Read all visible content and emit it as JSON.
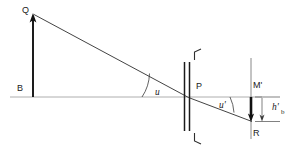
{
  "figure": {
    "kind": "optical-ray-diagram",
    "background_color": "#ffffff",
    "ink_color": "#1a1a1a",
    "axis_color": "#9a9a9a",
    "width": 293,
    "height": 150
  },
  "labels": {
    "object_top": "Q",
    "object_base": "B",
    "lens_vertex": "P",
    "image_plane_top": "M'",
    "image_point": "R",
    "angle_object": "u",
    "angle_image": "u'",
    "image_height": "h'",
    "image_height_sub": "b"
  },
  "geometry": {
    "optical_axis": {
      "x1": 10,
      "y1": 97,
      "x2": 262,
      "y2": 97
    },
    "object_arrow": {
      "x": 33,
      "y_base": 97,
      "y_tip": 16
    },
    "lens_plane_x": 188,
    "image_plane": {
      "x": 251,
      "y_top": 58,
      "y_bottom": 139
    },
    "image_arrow": {
      "x": 251,
      "y_base": 97,
      "y_tip": 121
    },
    "incident_ray": {
      "x1": 33,
      "y1": 16,
      "x2": 188,
      "y2": 97
    },
    "refracted_ray": {
      "x1": 188,
      "y1": 97,
      "x2": 251,
      "y2": 121
    },
    "dimension_line_x": 271
  },
  "icon_names": {
    "object_arrowhead": "arrow-up-icon",
    "image_arrowhead": "arrow-down-icon",
    "dimension_arrowhead": "arrow-down-icon",
    "angle_marker": "arc-icon"
  }
}
